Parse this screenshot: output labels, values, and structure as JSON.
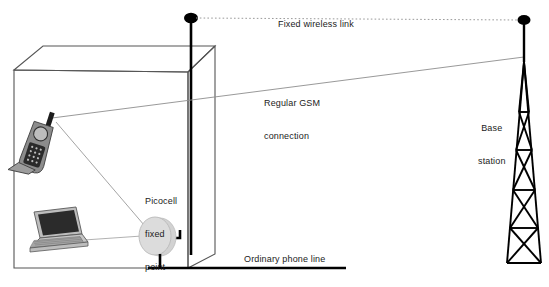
{
  "diagram": {
    "labels": {
      "fixed_wireless_link": "Fixed wireless link",
      "regular_gsm_line1": "Regular GSM",
      "regular_gsm_line2": "connection",
      "picocell_line1": "Picocell",
      "picocell_line2": "fixed",
      "picocell_line3": "point",
      "ordinary_phone_line": "Ordinary phone line",
      "base_station_line1": "Base",
      "base_station_line2": "station"
    },
    "colors": {
      "stroke_dark": "#000000",
      "stroke_building": "#4a4a4a",
      "thin_link": "#8a8a8a",
      "dotted_link": "#9a9a9a",
      "picocell_fill": "#d9d9d9",
      "picocell_edge": "#b4b4b4",
      "device_grey": "#b0b0b0",
      "screen_dark": "#222222",
      "text": "#1b1b1b",
      "background": "#ffffff"
    },
    "nodes": {
      "rooftop_antenna": "rooftop-antenna-mast",
      "base_station_tower": "lattice-tower",
      "picocell": "picocell-disc",
      "mobile_phone": "cordless-handset",
      "laptop": "laptop-computer",
      "building": "office-building-box"
    },
    "connections": [
      {
        "name": "fixed-wireless-link",
        "from": "rooftop-antenna-mast",
        "to": "lattice-tower",
        "style": "dotted"
      },
      {
        "name": "regular-gsm-connection",
        "from": "cordless-handset",
        "to": "lattice-tower",
        "style": "thin-solid"
      },
      {
        "name": "handset-to-picocell",
        "from": "cordless-handset",
        "to": "picocell-disc",
        "style": "thin-solid"
      },
      {
        "name": "laptop-to-picocell",
        "from": "laptop-computer",
        "to": "picocell-disc",
        "style": "thin-solid"
      },
      {
        "name": "picocell-to-mast-cable",
        "from": "picocell-disc",
        "to": "rooftop-antenna-mast",
        "style": "thick-solid"
      },
      {
        "name": "ordinary-phone-line",
        "from": "picocell-disc",
        "to": "exterior",
        "style": "thick-solid"
      }
    ]
  }
}
